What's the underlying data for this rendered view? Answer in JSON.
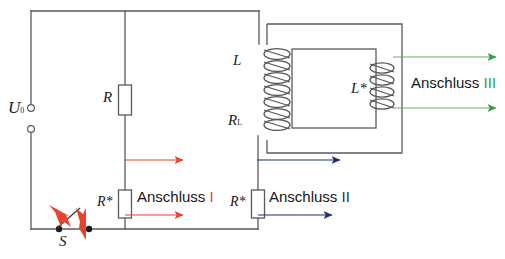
{
  "diagram": {
    "background_color": "#ffffff",
    "wire_color": "#5a5a5e",
    "labels": {
      "source": "U",
      "source_sub": "0",
      "switch": "S",
      "resistor_r": "R",
      "resistor_star_left": "R*",
      "resistor_star_right": "R*",
      "inductor_primary": "L",
      "resistor_coil": "R",
      "resistor_coil_sub": "L",
      "inductor_secondary": "L*"
    },
    "connections": [
      {
        "name": "anschluss-1",
        "word": "Anschluss",
        "numeral": "I",
        "color": "#e8412c",
        "arrow_count": 2
      },
      {
        "name": "anschluss-2",
        "word": "Anschluss",
        "numeral": "II",
        "color": "#1f2f6e",
        "arrow_count": 2
      },
      {
        "name": "anschluss-3",
        "word": "Anschluss",
        "numeral": "III",
        "color": "#2f9e44",
        "arrow_count": 2
      }
    ],
    "components": {
      "primary_coil_turns": 7,
      "secondary_coil_turns": 4,
      "switch_state": "open",
      "terminal_count": 2
    },
    "colors": {
      "red": "#e8412c",
      "navy": "#1f2f6e",
      "green": "#2f9e44",
      "wire": "#5a5a5e",
      "coil": "#55555a",
      "text": "#16161a"
    }
  }
}
